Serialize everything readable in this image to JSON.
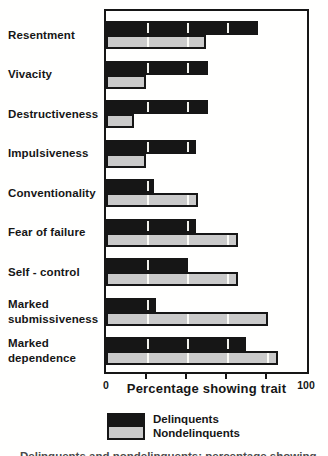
{
  "chart_data": {
    "type": "bar",
    "orientation": "horizontal",
    "xlabel": "Percentage showing trait",
    "xlim": [
      0,
      100
    ],
    "x_axis_end_labels": [
      "0",
      "100"
    ],
    "x_ticks_unlabeled": [
      20,
      40,
      60,
      80
    ],
    "legend_position": "bottom",
    "categories": [
      "Resentment",
      "Vivacity",
      "Destructiveness",
      "Impulsiveness",
      "Conventionality",
      "Fear of failure",
      "Self - control",
      "Marked submissiveness",
      "Marked dependence"
    ],
    "category_lines": [
      [
        "Resentment"
      ],
      [
        "Vivacity"
      ],
      [
        "Destructiveness"
      ],
      [
        "Impulsiveness"
      ],
      [
        "Conventionality"
      ],
      [
        "Fear of failure"
      ],
      [
        "Self - control"
      ],
      [
        "Marked",
        "submissiveness"
      ],
      [
        "Marked",
        "dependence"
      ]
    ],
    "series": [
      {
        "name": "Delinquents",
        "color": "#161616",
        "values": [
          76,
          51,
          51,
          45,
          24,
          45,
          41,
          25,
          70
        ]
      },
      {
        "name": "Nondelinquents",
        "color": "#cacaca",
        "values": [
          50,
          20,
          14,
          20,
          46,
          66,
          66,
          81,
          86
        ]
      }
    ]
  },
  "axis": {
    "min_label": "0",
    "max_label": "100",
    "title": "Percentage showing trait"
  },
  "legend": {
    "items": [
      {
        "label": "Delinquents",
        "color": "#161616"
      },
      {
        "label": "Nondelinquents",
        "color": "#cacaca"
      }
    ]
  },
  "clipped_caption": "Delinquents and nondelinquents: percentage showing each trait"
}
